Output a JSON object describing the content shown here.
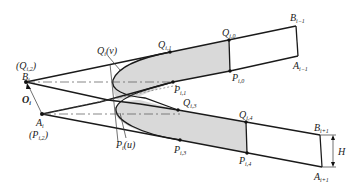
{
  "labels": {
    "Q_i2_paren": "(Q",
    "Q_i2_sub": "i,2",
    "B_i": "B",
    "B_i_sub": "i",
    "O_i": "O",
    "O_i_sub": "i",
    "A_i": "A",
    "A_i_sub": "i",
    "P_i2_paren": "(P",
    "P_i2_sub": "i,2",
    "Q_v": "Q",
    "Q_v_sub": "i",
    "Q_v_arg": "(v)",
    "P_u": "P",
    "P_u_sub": "i",
    "P_u_arg": "(u)",
    "Q_i1": "Q",
    "Q_i1_sub": "i,1",
    "Q_i0": "Q",
    "Q_i0_sub": "i,0",
    "P_i1": "P",
    "P_i1_sub": "i,1",
    "P_i0": "P",
    "P_i0_sub": "i,0",
    "Q_i3": "Q",
    "Q_i3_sub": "i,3",
    "P_i3": "P",
    "P_i3_sub": "i,3",
    "Q_i4": "Q",
    "Q_i4_sub": "i,4",
    "P_i4": "P",
    "P_i4_sub": "i,4",
    "B_im1": "B",
    "B_im1_sub": "i−1",
    "A_im1": "A",
    "A_im1_sub": "i−1",
    "B_ip1": "B",
    "B_ip1_sub": "i+1",
    "A_ip1": "A",
    "A_ip1_sub": "i+1",
    "H": "H",
    "close_paren": ")"
  },
  "colors": {
    "stroke": "#1a1a1a",
    "fill": "#d9d9d9",
    "background": "#ffffff"
  }
}
